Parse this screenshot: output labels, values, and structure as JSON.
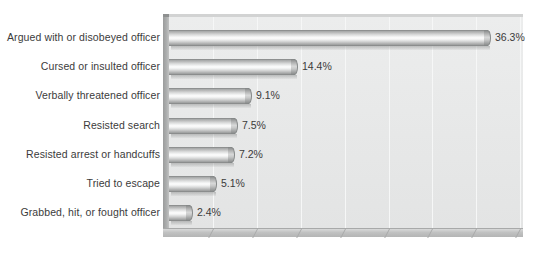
{
  "chart_data": {
    "type": "bar",
    "orientation": "horizontal",
    "title": "",
    "subtitle": "",
    "xlabel": "",
    "ylabel": "",
    "xlim": [
      0,
      41
    ],
    "grid": true,
    "gridline_interval": 5,
    "legend": "none",
    "value_suffix": "%",
    "categories": [
      "Argued with or disobeyed officer",
      "Cursed or insulted officer",
      "Verbally threatened officer",
      "Resisted search",
      "Resisted arrest or handcuffs",
      "Tried to escape",
      "Grabbed, hit, or fought officer"
    ],
    "values": [
      36.3,
      14.4,
      9.1,
      7.5,
      7.2,
      5.1,
      2.4
    ],
    "value_labels": [
      "36.3%",
      "14.4%",
      "9.1%",
      "7.5%",
      "7.2%",
      "5.1%",
      "2.4%"
    ],
    "colors": {
      "bar_light": "#fdfdfd",
      "bar_mid": "#c0c1c1",
      "bar_dark": "#8e9090",
      "plot_background": "#e8e9e9",
      "gridline": "#f6f7f7",
      "floor": "#b8b9b9",
      "text": "#3b3b3b",
      "page_background": "#ffffff"
    }
  }
}
